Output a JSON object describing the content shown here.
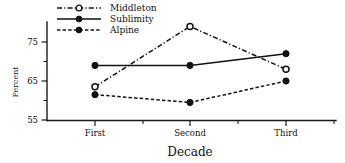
{
  "chart_data": {
    "type": "line",
    "title": "",
    "xlabel": "Decade",
    "ylabel": "Percent",
    "categories": [
      "First",
      "Second",
      "Third"
    ],
    "ylim": [
      55,
      80
    ],
    "yticks": [
      55,
      65,
      75
    ],
    "ytick_labels": [
      "55",
      "65",
      "75"
    ],
    "yminor_ticks": [
      60,
      70
    ],
    "grid": false,
    "legend_position": "top-left",
    "series": [
      {
        "name": "Middleton",
        "values": [
          63.5,
          79.0,
          68.0
        ],
        "marker": "open-circle",
        "line_style": "dash-dot"
      },
      {
        "name": "Sublimity",
        "values": [
          69.0,
          69.0,
          72.0
        ],
        "marker": "filled-circle",
        "line_style": "solid"
      },
      {
        "name": "Alpine",
        "values": [
          61.5,
          59.5,
          65.0
        ],
        "marker": "filled-circle",
        "line_style": "dashed"
      }
    ]
  },
  "legend": {
    "entries": [
      {
        "label": "Middleton"
      },
      {
        "label": "Sublimity"
      },
      {
        "label": "Alpine"
      }
    ]
  },
  "axis": {
    "x_title": "Decade",
    "y_title": "Percent",
    "x_categories": [
      "First",
      "Second",
      "Third"
    ],
    "y_labels": [
      "75",
      "65",
      "55"
    ]
  },
  "colors": {
    "ink": "#111111",
    "background": "#ffffff"
  }
}
